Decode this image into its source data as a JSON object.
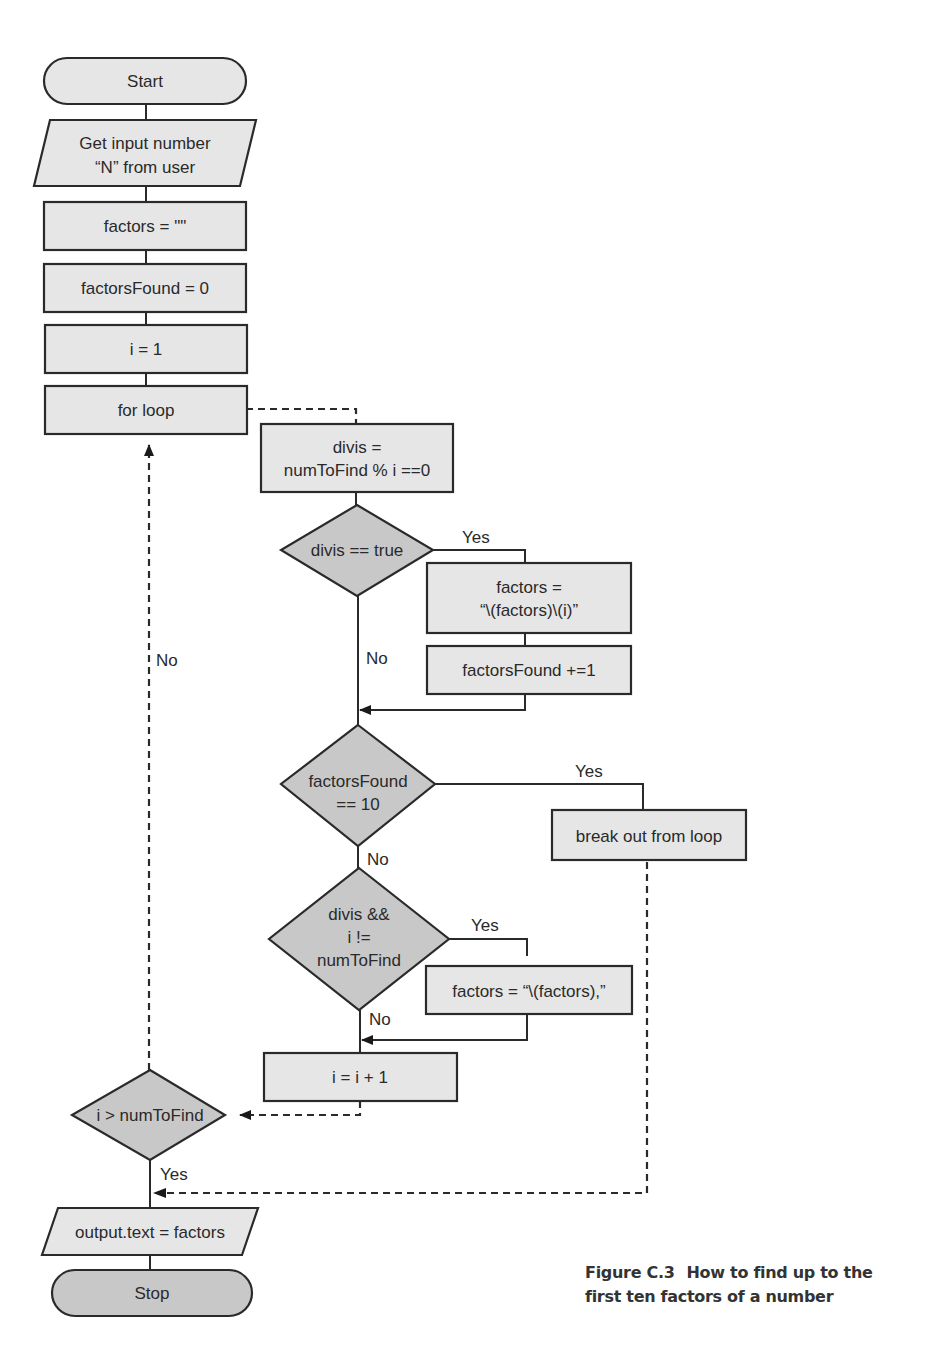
{
  "figure": {
    "number": "Figure C.3",
    "caption_line1": "How to find up to the",
    "caption_line2": "first ten factors of a number"
  },
  "nodes": {
    "start": {
      "type": "terminator",
      "label": "Start"
    },
    "get_input": {
      "type": "input-output",
      "line1": "Get input number",
      "line2": "“N” from user"
    },
    "factors_init": {
      "type": "process",
      "label": "factors = \"\""
    },
    "factors_found_init": {
      "type": "process",
      "label": "factorsFound = 0"
    },
    "i_init": {
      "type": "process",
      "label": "i = 1"
    },
    "for_loop": {
      "type": "process",
      "label": "for loop"
    },
    "divis_calc": {
      "type": "process",
      "line1": "divis =",
      "line2": "numToFind % i ==0"
    },
    "divis_check": {
      "type": "decision",
      "label": "divis == true"
    },
    "append_factor": {
      "type": "process",
      "line1": "factors =",
      "line2": "“\\(factors)\\(i)”"
    },
    "increment_found": {
      "type": "process",
      "label": "factorsFound +=1"
    },
    "found_check": {
      "type": "decision",
      "line1": "factorsFound",
      "line2": "== 10"
    },
    "break_loop": {
      "type": "process",
      "label": "break out from loop"
    },
    "comma_check": {
      "type": "decision",
      "line1": "divis &&",
      "line2": "i !=",
      "line3": "numToFind"
    },
    "append_comma": {
      "type": "process",
      "label": "factors = “\\(factors),”"
    },
    "increment_i": {
      "type": "process",
      "label": "i = i + 1"
    },
    "loop_check": {
      "type": "decision",
      "label": "i > numToFind"
    },
    "output": {
      "type": "input-output",
      "label": "output.text = factors"
    },
    "stop": {
      "type": "terminator",
      "label": "Stop"
    }
  },
  "edges": {
    "divis_yes": "Yes",
    "divis_no": "No",
    "found_yes": "Yes",
    "found_no": "No",
    "comma_yes": "Yes",
    "comma_no": "No",
    "loop_no": "No",
    "loop_yes": "Yes"
  },
  "colors": {
    "process_fill": "#e6e6e6",
    "decision_fill": "#c8c8c8",
    "stroke": "#2a2a2a"
  }
}
